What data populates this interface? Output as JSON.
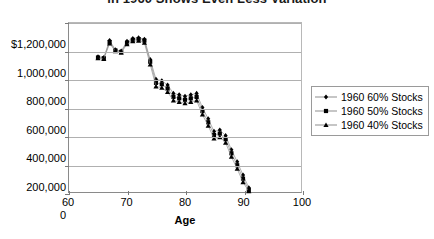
{
  "chart_data": {
    "type": "scatter",
    "title": "in 1960 Shows Even Less Variation",
    "xlabel": "Age",
    "ylabel": "",
    "xlim": [
      60,
      100
    ],
    "ylim": [
      0,
      1200000
    ],
    "xticks": [
      "60",
      "70",
      "80",
      "90",
      "100"
    ],
    "xtick_values": [
      60,
      70,
      80,
      90,
      100
    ],
    "yticks": [
      "$1,200,000",
      "1,000,000",
      "800,000",
      "600,000",
      "400,000",
      "200,000",
      "0"
    ],
    "ytick_values": [
      1200000,
      1000000,
      800000,
      600000,
      400000,
      200000,
      0
    ],
    "grid": true,
    "legend_position": "right",
    "x": [
      65,
      66,
      67,
      68,
      69,
      70,
      71,
      72,
      73,
      74,
      75,
      76,
      77,
      78,
      79,
      80,
      81,
      82,
      83,
      84,
      85,
      86,
      87,
      88,
      89,
      90,
      91
    ],
    "series": [
      {
        "name": "1960 60% Stocks",
        "marker": "diamond",
        "values": [
          960000,
          955000,
          1075000,
          1010000,
          1000000,
          1070000,
          1090000,
          1095000,
          1085000,
          940000,
          800000,
          790000,
          760000,
          700000,
          690000,
          680000,
          690000,
          700000,
          600000,
          520000,
          430000,
          440000,
          400000,
          300000,
          215000,
          120000,
          30000
        ]
      },
      {
        "name": "1960 50% Stocks",
        "marker": "square",
        "values": [
          955000,
          950000,
          1065000,
          1005000,
          995000,
          1060000,
          1080000,
          1085000,
          1075000,
          925000,
          775000,
          765000,
          735000,
          675000,
          665000,
          655000,
          665000,
          675000,
          575000,
          495000,
          405000,
          415000,
          375000,
          275000,
          190000,
          95000,
          15000
        ]
      },
      {
        "name": "1960 40% Stocks",
        "marker": "triangle",
        "values": [
          950000,
          945000,
          1055000,
          1000000,
          990000,
          1050000,
          1070000,
          1075000,
          1060000,
          905000,
          750000,
          740000,
          710000,
          650000,
          640000,
          630000,
          640000,
          650000,
          550000,
          470000,
          380000,
          390000,
          350000,
          250000,
          165000,
          70000,
          5000
        ]
      }
    ]
  }
}
